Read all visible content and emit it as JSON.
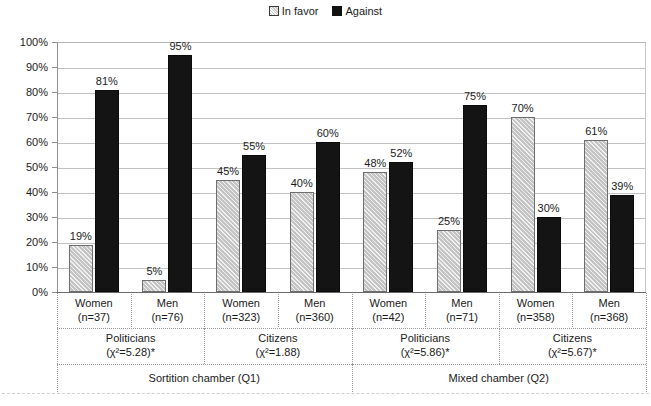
{
  "legend": {
    "items": [
      {
        "label": "In favor",
        "marker": "legend-swatch-in-favor",
        "color": "#c4c4c4"
      },
      {
        "label": "Against",
        "marker": "legend-swatch-against",
        "color": "#141414"
      }
    ]
  },
  "axis": {
    "y_ticks": [
      "100%",
      "90%",
      "80%",
      "70%",
      "60%",
      "50%",
      "40%",
      "30%",
      "20%",
      "10%",
      "0%"
    ]
  },
  "categories": [
    {
      "sex": "Women",
      "n": "(n=37)"
    },
    {
      "sex": "Men",
      "n": "(n=76)"
    },
    {
      "sex": "Women",
      "n": "(n=323)"
    },
    {
      "sex": "Men",
      "n": "(n=360)"
    },
    {
      "sex": "Women",
      "n": "(n=42)"
    },
    {
      "sex": "Men",
      "n": "(n=71)"
    },
    {
      "sex": "Women",
      "n": "(n=358)"
    },
    {
      "sex": "Men",
      "n": "(n=368)"
    }
  ],
  "groups": [
    {
      "name": "Politicians",
      "stat": "(χ²=5.28)*"
    },
    {
      "name": "Citizens",
      "stat": "(χ²=1.88)"
    },
    {
      "name": "Politicians",
      "stat": "(χ²=5.86)*"
    },
    {
      "name": "Citizens",
      "stat": "(χ²=5.67)*"
    }
  ],
  "chambers": [
    {
      "name": "Sortition chamber (Q1)"
    },
    {
      "name": "Mixed chamber (Q2)"
    }
  ],
  "bar_labels": {
    "g0": {
      "favor": "19%",
      "against": "81%"
    },
    "g1": {
      "favor": "5%",
      "against": "95%"
    },
    "g2": {
      "favor": "45%",
      "against": "55%"
    },
    "g3": {
      "favor": "40%",
      "against": "60%"
    },
    "g4": {
      "favor": "48%",
      "against": "52%"
    },
    "g5": {
      "favor": "25%",
      "against": "75%"
    },
    "g6": {
      "favor": "70%",
      "against": "30%"
    },
    "g7": {
      "favor": "61%",
      "against": "39%"
    }
  },
  "chart_data": {
    "type": "bar",
    "title": "",
    "xlabel": "",
    "ylabel": "",
    "ylim": [
      0,
      100
    ],
    "ytick_step": 10,
    "grid": true,
    "legend_position": "top-center",
    "categories": [
      "Women (n=37)",
      "Men (n=76)",
      "Women (n=323)",
      "Men (n=360)",
      "Women (n=42)",
      "Men (n=71)",
      "Women (n=358)",
      "Men (n=368)"
    ],
    "series": [
      {
        "name": "In favor",
        "color": "#c4c4c4",
        "values": [
          19,
          5,
          45,
          40,
          48,
          25,
          70,
          61
        ]
      },
      {
        "name": "Against",
        "color": "#141414",
        "values": [
          81,
          95,
          55,
          60,
          52,
          75,
          30,
          39
        ]
      }
    ],
    "group_annotations": [
      {
        "label": "Politicians",
        "stat": "(χ²=5.28)*",
        "categories": [
          0,
          1
        ]
      },
      {
        "label": "Citizens",
        "stat": "(χ²=1.88)",
        "categories": [
          2,
          3
        ]
      },
      {
        "label": "Politicians",
        "stat": "(χ²=5.86)*",
        "categories": [
          4,
          5
        ]
      },
      {
        "label": "Citizens",
        "stat": "(χ²=5.67)*",
        "categories": [
          6,
          7
        ]
      }
    ],
    "super_group_annotations": [
      {
        "label": "Sortition chamber (Q1)",
        "categories": [
          0,
          1,
          2,
          3
        ]
      },
      {
        "label": "Mixed chamber (Q2)",
        "categories": [
          4,
          5,
          6,
          7
        ]
      }
    ]
  }
}
